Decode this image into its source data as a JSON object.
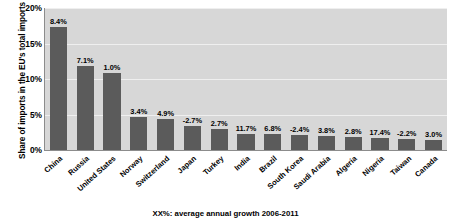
{
  "chart_data": {
    "type": "bar",
    "title": "",
    "xlabel": "",
    "ylabel": "Share of imports in the EU's total imports",
    "ylim": [
      0,
      20
    ],
    "ytick_labels": [
      "0%",
      "5%",
      "10%",
      "15%",
      "20%"
    ],
    "ytick_values": [
      0,
      5,
      10,
      15,
      20
    ],
    "grid": true,
    "legend": "none",
    "categories": [
      "China",
      "Russia",
      "United States",
      "Norway",
      "Switzerland",
      "Japan",
      "Turkey",
      "India",
      "Brazil",
      "South Korea",
      "Saudi Arabia",
      "Algeria",
      "Nigeria",
      "Taiwan",
      "Canada"
    ],
    "values": [
      17.3,
      11.8,
      10.9,
      4.7,
      4.3,
      3.4,
      2.9,
      2.3,
      2.2,
      2.1,
      2.0,
      1.8,
      1.7,
      1.5,
      1.4
    ],
    "bar_labels": [
      "8.4%",
      "7.1%",
      "1.0%",
      "3.4%",
      "4.9%",
      "-2.7%",
      "2.7%",
      "11.7%",
      "6.8%",
      "-2.4%",
      "3.8%",
      "2.8%",
      "17.4%",
      "-2.2%",
      "3.0%"
    ],
    "annotation": "XX%: average annual growth 2006-2011",
    "colors": {
      "bar": "#5b5b5b",
      "plot_background": "#d7d7d7",
      "gridline": "#efefef",
      "axis": "#8c8c8c",
      "text": "#000000"
    }
  }
}
